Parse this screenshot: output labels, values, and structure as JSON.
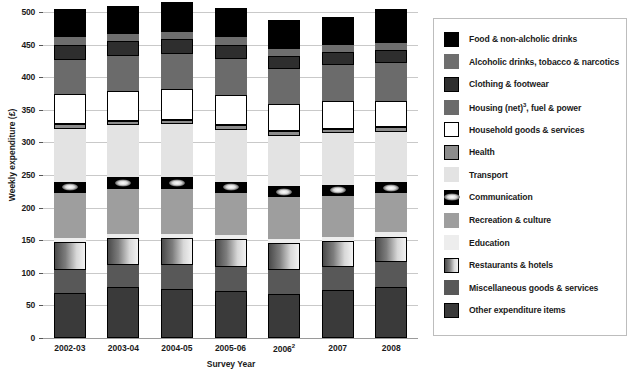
{
  "chart_data": {
    "type": "bar",
    "subtype": "stacked-bar",
    "title": "",
    "xlabel": "Survey Year",
    "ylabel": "Weekly expenditure (£)",
    "ylim": [
      0,
      500
    ],
    "yticks": [
      0,
      50,
      100,
      150,
      200,
      250,
      300,
      350,
      400,
      450,
      500
    ],
    "grid": true,
    "legend_position": "right",
    "categories": [
      "2002-03",
      "2003-04",
      "2004-05",
      "2005-06",
      "2006",
      "2007",
      "2008"
    ],
    "category_labels": [
      "2002-03",
      "2003-04",
      "2004-05",
      "2005-06",
      "2006²",
      "2007",
      "2008"
    ],
    "category_footnotes": [
      "",
      "",
      "",
      "",
      "2",
      "",
      ""
    ],
    "series": [
      {
        "name": "Other expenditure items",
        "color": "#3a3a3a",
        "values": [
          69,
          78,
          75,
          72,
          68,
          73,
          78
        ]
      },
      {
        "name": "Miscellaneous goods & services",
        "color": "#585858",
        "values": [
          35,
          34,
          37,
          37,
          36,
          36,
          38
        ]
      },
      {
        "name": "Restaurants & hotels",
        "color": "#a8a8a8",
        "values": [
          43,
          41,
          42,
          43,
          42,
          40,
          39
        ]
      },
      {
        "name": "Education",
        "color": "#ededed",
        "values": [
          6,
          6,
          6,
          6,
          6,
          6,
          7
        ]
      },
      {
        "name": "Recreation & culture",
        "color": "#9e9e9e",
        "values": [
          69,
          70,
          69,
          65,
          64,
          63,
          60
        ]
      },
      {
        "name": "Communication",
        "color": "#000000",
        "values": [
          18,
          18,
          18,
          17,
          17,
          17,
          17
        ]
      },
      {
        "name": "Transport",
        "color": "#e3e3e3",
        "values": [
          81,
          79,
          81,
          79,
          77,
          79,
          77
        ]
      },
      {
        "name": "Health",
        "color": "#8c8c8c",
        "values": [
          7,
          7,
          7,
          7,
          7,
          7,
          7
        ]
      },
      {
        "name": "Household goods & services",
        "color": "#ffffff",
        "values": [
          46,
          46,
          47,
          47,
          42,
          42,
          41
        ]
      },
      {
        "name": "Housing (net)³, fuel & power",
        "color": "#6b6b6b",
        "values": [
          53,
          53,
          53,
          55,
          53,
          55,
          58
        ]
      },
      {
        "name": "Clothing & footwear",
        "color": "#2e2e2e",
        "values": [
          23,
          23,
          23,
          22,
          21,
          21,
          20
        ]
      },
      {
        "name": "Alcoholic drinks, tobacco & narcotics",
        "color": "#6e6e6e",
        "values": [
          12,
          12,
          12,
          12,
          11,
          11,
          11
        ]
      },
      {
        "name": "Food & non-alcholic drinks",
        "color": "#000000",
        "values": [
          43,
          42,
          45,
          44,
          44,
          42,
          51
        ]
      }
    ]
  },
  "axes": {
    "ylabel": "Weekly expenditure (£)",
    "xlabel": "Survey Year",
    "yticks": [
      "500",
      "450",
      "400",
      "350",
      "300",
      "250",
      "200",
      "150",
      "100",
      "50",
      "0"
    ]
  },
  "legend": {
    "items": [
      {
        "label": "Food & non-alcholic drinks",
        "swatch": "food-swatch"
      },
      {
        "label": "Alcoholic drinks, tobacco & narcotics",
        "swatch": "alcohol-swatch"
      },
      {
        "label": "Clothing & footwear",
        "swatch": "clothing-swatch"
      },
      {
        "label": "Housing (net)³, fuel & power",
        "swatch": "housing-swatch"
      },
      {
        "label": "Household goods & services",
        "swatch": "household-goods-swatch"
      },
      {
        "label": "Health",
        "swatch": "health-swatch"
      },
      {
        "label": "Transport",
        "swatch": "transport-swatch"
      },
      {
        "label": "Communication",
        "swatch": "communication-swatch"
      },
      {
        "label": "Recreation & culture",
        "swatch": "recreation-swatch"
      },
      {
        "label": "Education",
        "swatch": "education-swatch"
      },
      {
        "label": "Restaurants & hotels",
        "swatch": "restaurants-swatch"
      },
      {
        "label": "Miscellaneous goods & services",
        "swatch": "miscellaneous-swatch"
      },
      {
        "label": "Other expenditure items",
        "swatch": "other-swatch"
      }
    ]
  }
}
